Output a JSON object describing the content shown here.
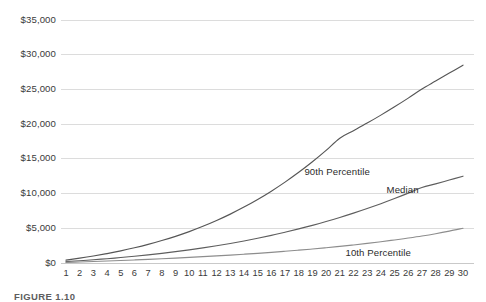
{
  "caption": "FIGURE 1.10",
  "chart_data": {
    "type": "line",
    "title": "",
    "subtitle": "",
    "xlabel": "",
    "ylabel": "",
    "grid": true,
    "legend_position": "inline",
    "xlim": [
      1,
      30
    ],
    "ylim": [
      0,
      35000
    ],
    "x": [
      1,
      2,
      3,
      4,
      5,
      6,
      7,
      8,
      9,
      10,
      11,
      12,
      13,
      14,
      15,
      16,
      17,
      18,
      19,
      20,
      21,
      22,
      23,
      24,
      25,
      26,
      27,
      28,
      29,
      30
    ],
    "xtick_labels": [
      "1",
      "2",
      "3",
      "4",
      "5",
      "6",
      "7",
      "8",
      "9",
      "10",
      "11",
      "12",
      "13",
      "14",
      "15",
      "16",
      "17",
      "18",
      "19",
      "20",
      "21",
      "22",
      "23",
      "24",
      "25",
      "26",
      "27",
      "28",
      "29",
      "30"
    ],
    "ytick_values": [
      0,
      5000,
      10000,
      15000,
      20000,
      25000,
      30000,
      35000
    ],
    "ytick_labels": [
      "$0",
      "$5,000",
      "$10,000",
      "$15,000",
      "$20,000",
      "$25,000",
      "$30,000",
      "$35,000"
    ],
    "series": [
      {
        "name": "90th Percentile",
        "color": "#565656",
        "label_x": 19,
        "label_y": 13100,
        "values": [
          420,
          700,
          1010,
          1360,
          1750,
          2190,
          2680,
          3230,
          3840,
          4520,
          5280,
          6120,
          7040,
          8050,
          9150,
          10350,
          11650,
          13060,
          14580,
          16220,
          17980,
          19060,
          20150,
          21300,
          22500,
          23750,
          25050,
          26200,
          27350,
          28500
        ]
      },
      {
        "name": "Median",
        "color": "#5e5e5e",
        "label_x": 25,
        "label_y": 10500,
        "values": [
          200,
          330,
          470,
          620,
          790,
          970,
          1170,
          1390,
          1630,
          1890,
          2170,
          2480,
          2810,
          3170,
          3560,
          3980,
          4430,
          4910,
          5420,
          5970,
          6560,
          7180,
          7840,
          8540,
          9280,
          10060,
          10880,
          11400,
          11950,
          12500
        ]
      },
      {
        "name": "10th Percentile",
        "color": "#8d8d8d",
        "label_x": 22,
        "label_y": 1350,
        "values": [
          90,
          150,
          215,
          285,
          360,
          440,
          525,
          615,
          710,
          810,
          915,
          1025,
          1140,
          1265,
          1395,
          1535,
          1685,
          1845,
          2015,
          2195,
          2390,
          2600,
          2825,
          3065,
          3320,
          3595,
          3890,
          4220,
          4590,
          5000
        ]
      }
    ]
  }
}
